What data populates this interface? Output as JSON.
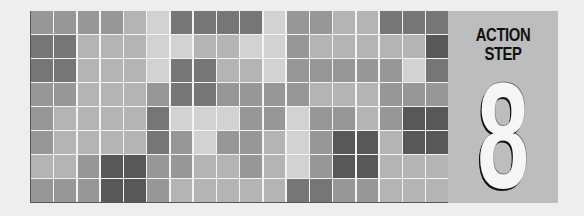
{
  "panel": {
    "title_line1": "ACTION",
    "title_line2": "STEP",
    "number": "8",
    "background": "#bdbdbd"
  },
  "palette": {
    "1": "#d2d2d2",
    "2": "#b4b4b4",
    "3": "#979797",
    "4": "#767676",
    "5": "#585858"
  },
  "grid": {
    "columns": 18,
    "rows": 8,
    "shades": [
      [
        3,
        3,
        3,
        3,
        2,
        1,
        4,
        4,
        4,
        4,
        1,
        3,
        3,
        2,
        2,
        4,
        4,
        4
      ],
      [
        4,
        4,
        2,
        2,
        2,
        1,
        1,
        2,
        2,
        1,
        1,
        3,
        2,
        2,
        2,
        2,
        2,
        5
      ],
      [
        4,
        4,
        2,
        2,
        2,
        1,
        4,
        4,
        2,
        2,
        1,
        3,
        3,
        3,
        3,
        3,
        1,
        4
      ],
      [
        3,
        3,
        2,
        2,
        2,
        3,
        4,
        4,
        3,
        3,
        3,
        3,
        2,
        2,
        2,
        3,
        3,
        3
      ],
      [
        3,
        2,
        2,
        2,
        2,
        4,
        1,
        1,
        1,
        3,
        3,
        1,
        3,
        3,
        2,
        3,
        5,
        5
      ],
      [
        3,
        2,
        2,
        2,
        2,
        4,
        3,
        1,
        3,
        3,
        2,
        1,
        3,
        5,
        5,
        2,
        5,
        5
      ],
      [
        2,
        2,
        3,
        5,
        5,
        3,
        3,
        2,
        2,
        3,
        2,
        1,
        3,
        5,
        5,
        2,
        2,
        2
      ],
      [
        3,
        3,
        3,
        5,
        5,
        3,
        2,
        2,
        2,
        2,
        2,
        4,
        4,
        3,
        3,
        2,
        2,
        2
      ]
    ]
  }
}
